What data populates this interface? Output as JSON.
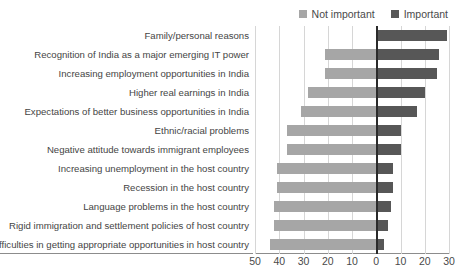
{
  "legend": {
    "position": "top-right",
    "entries": [
      {
        "label": "Not important",
        "color": "#a6a6a6"
      },
      {
        "label": "Important",
        "color": "#575757"
      }
    ]
  },
  "chart_data": {
    "type": "bar",
    "orientation": "horizontal",
    "layout": "diverging-tornado",
    "title": "",
    "xlabel": "",
    "ylabel": "",
    "grid": true,
    "xlim": [
      -50,
      30
    ],
    "xticks": [
      -50,
      -40,
      -30,
      -20,
      -10,
      0,
      10,
      20,
      30
    ],
    "xticklabels": [
      "50",
      "40",
      "30",
      "20",
      "10",
      "0",
      "10",
      "20",
      "30"
    ],
    "categories": [
      "Family/personal reasons",
      "Recognition of India as a major emerging IT power",
      "Increasing employment opportunities in India",
      "Higher real earnings in India",
      "Expectations of better business opportunities in India",
      "Ethnic/racial problems",
      "Negative attitude towards immigrant employees",
      "Increasing unemployment in the host country",
      "Recession in the host country",
      "Language problems in the host country",
      "Rigid immigration and settlement policies of host country",
      "Difficulties in getting appropriate opportunities in host country"
    ],
    "series": [
      {
        "name": "Not important",
        "color": "#a6a6a6",
        "side": "left",
        "values": [
          0,
          21,
          21,
          28,
          31,
          37,
          37,
          41,
          41,
          42,
          42,
          44
        ]
      },
      {
        "name": "Important",
        "color": "#575757",
        "side": "right",
        "values": [
          29,
          26,
          25,
          20,
          17,
          10,
          10,
          7,
          7,
          6,
          5,
          3
        ]
      }
    ]
  },
  "colors": {
    "not_important": "#a6a6a6",
    "important": "#575757",
    "grid": "#d6d6d6",
    "zero_axis": "#2b2b2b",
    "axis": "#8c8c8c",
    "text": "#454545",
    "background": "#ffffff"
  }
}
